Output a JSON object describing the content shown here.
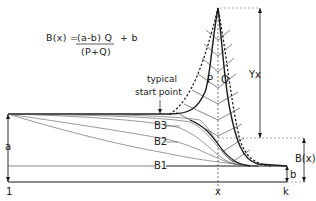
{
  "formula": {
    "lhs": "B(x) =",
    "numerator": "(a-b) Q",
    "plus": "+ b",
    "denominator": "(P+Q)"
  },
  "labels": {
    "typical_start_point_line1": "typical",
    "typical_start_point_line2": "start point",
    "P": "P",
    "Q": "Q",
    "Yx": "Yx",
    "B3": "B3",
    "B2": "B2",
    "B1": "B1",
    "a": "a",
    "b": "b",
    "Bx": "B(x)",
    "x": "x",
    "k": "k",
    "one": "1"
  },
  "colors": {
    "ink": "#1a1a1a",
    "thin": "#555555",
    "dashed": "#777777",
    "background": "#ffffff"
  }
}
